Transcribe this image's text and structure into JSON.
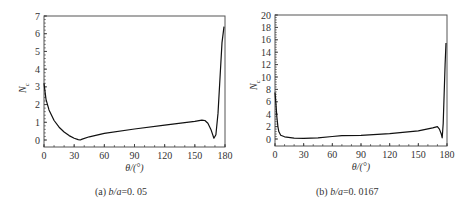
{
  "chart_data": [
    {
      "type": "line",
      "panel": "a",
      "caption_prefix": "(a) ",
      "caption_var": "b/a",
      "caption_value": "=0. 05",
      "xlabel": "θ/(°)",
      "ylabel": "N",
      "ylabel_sub": "c",
      "xlim": [
        0,
        180
      ],
      "ylim": [
        0,
        7
      ],
      "xticks": [
        0,
        30,
        60,
        90,
        120,
        150,
        180
      ],
      "yticks": [
        0,
        1,
        2,
        3,
        4,
        5,
        6,
        7
      ],
      "grid": false,
      "series": [
        {
          "name": "Nc",
          "x": [
            0,
            2,
            5,
            10,
            15,
            20,
            25,
            30,
            34,
            36,
            38,
            45,
            60,
            90,
            120,
            150,
            157,
            160,
            163,
            166,
            169,
            171,
            173,
            175,
            177,
            179
          ],
          "y": [
            3.2,
            2.3,
            1.7,
            1.1,
            0.72,
            0.45,
            0.25,
            0.1,
            0.02,
            0.0,
            0.05,
            0.18,
            0.38,
            0.62,
            0.84,
            1.05,
            1.12,
            1.1,
            0.95,
            0.6,
            0.1,
            0.3,
            1.5,
            3.5,
            5.5,
            6.4
          ]
        }
      ]
    },
    {
      "type": "line",
      "panel": "b",
      "caption_prefix": "(b) ",
      "caption_var": "b/a",
      "caption_value": "=0. 0167",
      "xlabel": "θ/(°)",
      "ylabel": "N",
      "ylabel_sub": "c",
      "xlim": [
        0,
        180
      ],
      "ylim": [
        0,
        20
      ],
      "xticks": [
        0,
        30,
        60,
        90,
        120,
        150,
        180
      ],
      "yticks": [
        0,
        2,
        4,
        6,
        8,
        10,
        12,
        14,
        16,
        18,
        20
      ],
      "grid": false,
      "series": [
        {
          "name": "Nc",
          "x": [
            0,
            1,
            2,
            3,
            4,
            6,
            10,
            20,
            30,
            45,
            60,
            70,
            90,
            120,
            150,
            165,
            170,
            172,
            174,
            175,
            176,
            177,
            178,
            179
          ],
          "y": [
            7.5,
            5.5,
            3.5,
            2.0,
            1.2,
            0.6,
            0.35,
            0.15,
            0.1,
            0.2,
            0.4,
            0.55,
            0.6,
            0.85,
            1.3,
            1.8,
            2.0,
            1.6,
            0.8,
            0.2,
            2.5,
            7.0,
            12.0,
            15.5
          ]
        }
      ]
    }
  ]
}
